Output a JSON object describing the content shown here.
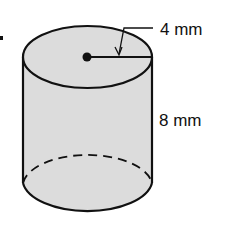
{
  "figure": {
    "type": "cylinder",
    "labels": {
      "radius": "4 mm",
      "height": "8 mm"
    },
    "colors": {
      "fill": "#dcdcdc",
      "stroke": "#111111",
      "background": "#ffffff"
    }
  }
}
